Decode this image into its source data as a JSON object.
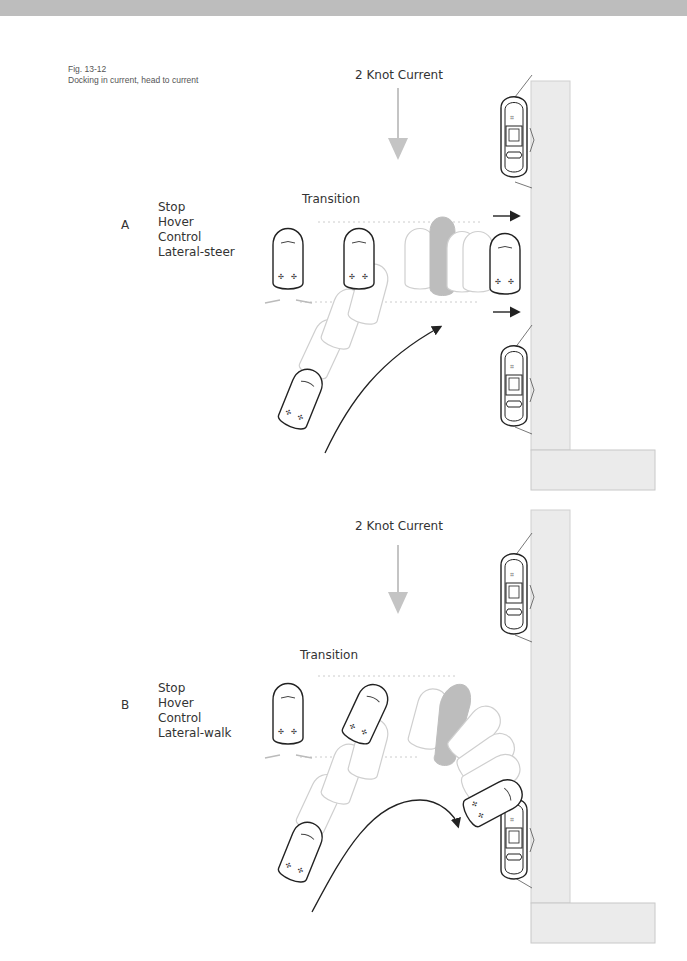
{
  "figure": {
    "number": "Fig. 13-12",
    "caption": "Docking in current, head to current"
  },
  "panels": [
    {
      "id": "A",
      "letter": "A",
      "current_label": "2 Knot Current",
      "transition_label": "Transition",
      "steps": [
        "Stop",
        "Hover",
        "Control",
        "Lateral-steer"
      ]
    },
    {
      "id": "B",
      "letter": "B",
      "current_label": "2 Knot Current",
      "transition_label": "Transition",
      "steps": [
        "Stop",
        "Hover",
        "Control",
        "Lateral-walk"
      ]
    }
  ],
  "colors": {
    "dock": "#ebebeb",
    "dock_edge": "#c8c8c8",
    "current_arrow": "#c4c4c4",
    "ghost_boat": "#cfcfcf",
    "highlight_boat": "#bdbdbd",
    "ink": "#222222"
  }
}
